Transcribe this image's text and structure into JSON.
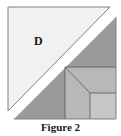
{
  "figure": {
    "caption": "Figure 2",
    "labels": {
      "triangle": "D"
    },
    "colors": {
      "light_triangle": "#f1f1f1",
      "white_strip": "#ffffff",
      "dark_gray": "#9a9a9a",
      "medium_gray": "#b3b3b3",
      "light_gray": "#c4c4c4",
      "lines": "#555555",
      "border": "#808080"
    }
  }
}
